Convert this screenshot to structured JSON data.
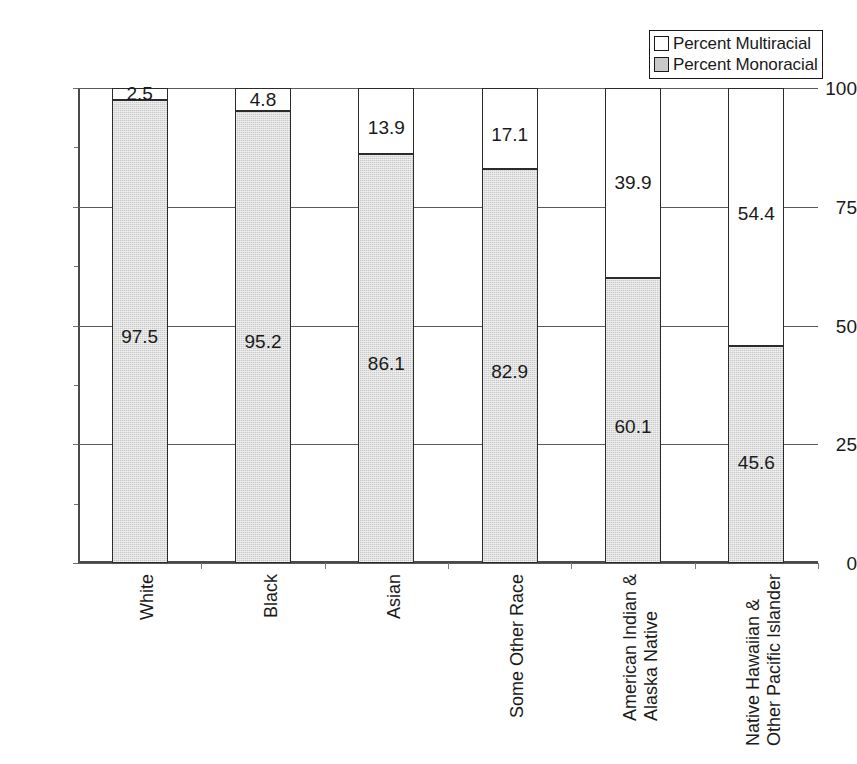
{
  "chart_data": {
    "type": "bar",
    "subtype": "stacked-bar-100",
    "title": "",
    "xlabel": "",
    "ylabel": "",
    "ylim": [
      0,
      100
    ],
    "yticks": [
      0,
      25,
      50,
      75,
      100
    ],
    "ytick_labels": [
      "0",
      "25",
      "50",
      "75",
      "100"
    ],
    "grid": true,
    "legend_position": "top-right",
    "categories": [
      "White",
      "Black",
      "Asian",
      "Some Other Race",
      "American Indian & Alaska Native",
      "Native Hawaiian & Other Pacific Islander"
    ],
    "category_lines": [
      [
        "White"
      ],
      [
        "Black"
      ],
      [
        "Asian"
      ],
      [
        "Some Other Race"
      ],
      [
        "American Indian &",
        "Alaska Native"
      ],
      [
        "Native Hawaiian &",
        "Other Pacific Islander"
      ]
    ],
    "series": [
      {
        "name": "Percent Monoracial",
        "color": "#c9c9c9",
        "values": [
          97.5,
          95.2,
          86.1,
          82.9,
          60.1,
          45.6
        ],
        "labels": [
          "97.5",
          "95.2",
          "86.1",
          "82.9",
          "60.1",
          "45.6"
        ]
      },
      {
        "name": "Percent Multiracial",
        "color": "#ffffff",
        "values": [
          2.5,
          4.8,
          13.9,
          17.1,
          39.9,
          54.4
        ],
        "labels": [
          "2.5",
          "4.8",
          "13.9",
          "17.1",
          "39.9",
          "54.4"
        ]
      }
    ]
  },
  "legend": {
    "items": [
      {
        "label": "Percent Multiracial",
        "swatch": "white"
      },
      {
        "label": "Percent Monoracial",
        "swatch": "gray"
      }
    ]
  },
  "colors": {
    "monoracial_fill": "#c9c9c9",
    "multiracial_fill": "#ffffff",
    "outline": "#2b2b2b",
    "axis": "#4a4a4a",
    "text": "#1a1a1a"
  }
}
